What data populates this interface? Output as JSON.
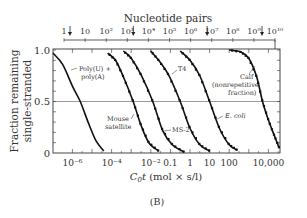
{
  "figure_label": "(B)",
  "chart_data": {
    "type": "line",
    "title": "",
    "xlabel": "C0t (mol × s/l)",
    "xlabel_main": "C",
    "xlabel_sub": "0",
    "xlabel_rest": "t (mol × s/l)",
    "ylabel_line1": "Fraction remaining",
    "ylabel_line2": "single-stranded",
    "x_scale": "log",
    "xlim_log10": [
      -7,
      4.6
    ],
    "ylim": [
      0,
      1.0
    ],
    "y_ticks": [
      "0",
      "0.5",
      "1.0"
    ],
    "x_ticks": [
      {
        "label": "10⁻⁶",
        "log10": -6
      },
      {
        "label": "10⁻⁴",
        "log10": -4
      },
      {
        "label": "10⁻²",
        "log10": -2
      },
      {
        "label": "0.1",
        "log10": -1
      },
      {
        "label": "1",
        "log10": 0
      },
      {
        "label": "10",
        "log10": 1
      },
      {
        "label": "100",
        "log10": 2
      },
      {
        "label": "10,000",
        "log10": 4
      }
    ],
    "top_axis": {
      "label": "Nucleotide pairs",
      "ticks": [
        "1",
        "10",
        "10²",
        "10³",
        "10⁴",
        "10⁵",
        "10⁶",
        "10⁷",
        "10⁸",
        "10⁹",
        "10¹⁰"
      ],
      "arrows_at_log10": [
        0,
        3,
        6.5,
        9.1
      ]
    },
    "gridline_y": 0.5,
    "series": [
      {
        "name": "Poly(U) + poly(A)",
        "midpoint_log10_c0t": -5.6,
        "x_log10": [
          -7,
          -6.5,
          -6,
          -5.6,
          -5.2,
          -4.8,
          -4.4
        ],
        "y": [
          0.97,
          0.86,
          0.65,
          0.5,
          0.3,
          0.12,
          0.02
        ]
      },
      {
        "name": "Mouse satellite",
        "midpoint_log10_c0t": -2.9,
        "x_log10": [
          -4.2,
          -3.8,
          -3.4,
          -2.9,
          -2.5,
          -2.1,
          -1.6
        ],
        "y": [
          0.97,
          0.9,
          0.74,
          0.5,
          0.27,
          0.1,
          0.02
        ]
      },
      {
        "name": "MS-2",
        "midpoint_log10_c0t": -1.9,
        "x_log10": [
          -3.4,
          -3.0,
          -2.5,
          -1.9,
          -1.4,
          -0.9,
          -0.3
        ],
        "y": [
          0.99,
          0.92,
          0.76,
          0.5,
          0.22,
          0.08,
          0.01
        ]
      },
      {
        "name": "T4",
        "midpoint_log10_c0t": -0.5,
        "x_log10": [
          -2.0,
          -1.6,
          -1.1,
          -0.5,
          0.0,
          0.5,
          1.0
        ],
        "y": [
          0.99,
          0.9,
          0.76,
          0.5,
          0.24,
          0.08,
          0.02
        ]
      },
      {
        "name": "E. coli",
        "midpoint_log10_c0t": 1.0,
        "x_log10": [
          -0.5,
          0.0,
          0.5,
          1.0,
          1.5,
          2.0,
          2.4
        ],
        "y": [
          0.99,
          0.9,
          0.75,
          0.5,
          0.24,
          0.08,
          0.03
        ]
      },
      {
        "name": "Calf (nonrepetitive fraction)",
        "midpoint_log10_c0t": 3.7,
        "x_log10": [
          2.0,
          2.6,
          3.0,
          3.4,
          3.7,
          4.0,
          4.3,
          4.55
        ],
        "y": [
          1.0,
          0.98,
          0.92,
          0.74,
          0.5,
          0.32,
          0.17,
          0.05
        ]
      }
    ],
    "annotations": [
      "Poly(U) + poly(A)",
      "Mouse satellite",
      "MS-2",
      "T4",
      "E. coli",
      "Calf (nonrepetitive fraction)"
    ],
    "grid": false,
    "legend": "none (inline labels)"
  },
  "labels": {
    "polyua_1": "Poly(U) +",
    "polyua_2": "poly(A)",
    "mouse_1": "Mouse",
    "mouse_2": "satellite",
    "ms2": "MS-2",
    "t4": "T4",
    "ecoli": "E. coli",
    "calf_1": "Calf",
    "calf_2": "(nonrepetitive",
    "calf_3": "fraction)"
  }
}
